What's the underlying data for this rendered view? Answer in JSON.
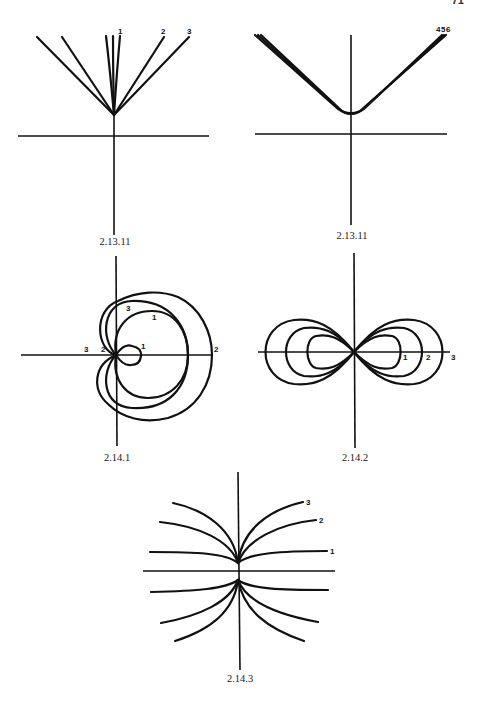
{
  "page": {
    "number": "71"
  },
  "figures": [
    {
      "id": "fig-2-13-11-a",
      "caption": "2.13.11",
      "curve_labels": [
        "1",
        "2",
        "3"
      ]
    },
    {
      "id": "fig-2-13-11-b",
      "caption": "2.13.11",
      "curve_labels": [
        "4",
        "5",
        "6"
      ]
    },
    {
      "id": "fig-2-14-1",
      "caption": "2.14.1",
      "curve_labels": [
        "1",
        "1",
        "2",
        "2",
        "3",
        "3"
      ]
    },
    {
      "id": "fig-2-14-2",
      "caption": "2.14.2",
      "curve_labels": [
        "1",
        "2",
        "3"
      ]
    },
    {
      "id": "fig-2-14-3",
      "caption": "2.14.3",
      "curve_labels": [
        "1",
        "2",
        "3"
      ]
    }
  ]
}
